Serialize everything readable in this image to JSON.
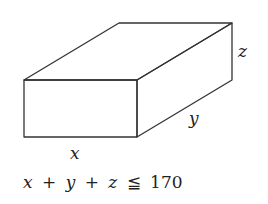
{
  "diagram": {
    "type": "rectangular-box",
    "labels": {
      "width": "x",
      "depth": "y",
      "height": "z"
    },
    "constraint": {
      "terms": [
        "x",
        "+",
        "y",
        "+",
        "z",
        "≦",
        "170"
      ],
      "text": "x + y + z ≦ 170",
      "limit": "170"
    },
    "stroke_color": "#333333",
    "background": "#ffffff"
  }
}
